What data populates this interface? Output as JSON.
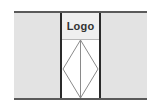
{
  "layout": {
    "header_logo": {
      "label": "Logo"
    },
    "image_placeholder": {
      "icon": "image-placeholder-icon",
      "stroke_color": "#8a8a8a"
    },
    "colors": {
      "side_panel": "#e3e3e3",
      "rule": "#5a5a5a",
      "column_border": "#2a2a2a",
      "logo_bg": "#efefef"
    }
  }
}
